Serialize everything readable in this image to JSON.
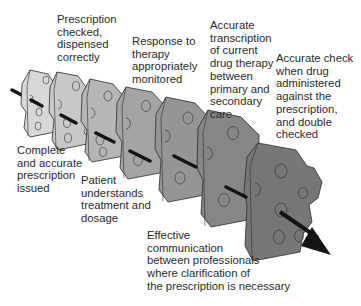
{
  "colors": {
    "background": "#ffffff",
    "text": "#2a2a2a",
    "outline": "#2b2b2b",
    "arrow": "#141414",
    "slice_fills": [
      "#dcdcdc",
      "#c9c9c9",
      "#b7b7b7",
      "#a5a5a5",
      "#959595",
      "#868686",
      "#787878"
    ]
  },
  "icons": {
    "cheese_slice": "cheese-slice-icon",
    "arrow": "trajectory-arrow-icon"
  },
  "labels": [
    {
      "id": "complete-prescription",
      "text": "Complete\nand accurate\nprescription\nissued",
      "position": "below",
      "slice": 1
    },
    {
      "id": "prescription-checked",
      "text": "Prescription\nchecked,\ndispensed\ncorrectly",
      "position": "above",
      "slice": 2
    },
    {
      "id": "patient-understands",
      "text": "Patient\nunderstands\ntreatment and\ndosage",
      "position": "below",
      "slice": 3
    },
    {
      "id": "response-monitored",
      "text": "Response to\ntherapy\nappropriately\nmonitored",
      "position": "above",
      "slice": 4
    },
    {
      "id": "effective-communication",
      "text": "Effective\ncommunication\nbetween professionals\nwhere clarification of\nthe prescription is necessary",
      "position": "below",
      "slice": 5
    },
    {
      "id": "accurate-transcription",
      "text": "Accurate\ntranscription\nof current\ndrug therapy\nbetween\nprimary and\nsecondary\ncare",
      "position": "above",
      "slice": 6
    },
    {
      "id": "accurate-check",
      "text": "Accurate check\nwhen drug\nadministered\nagainst the\nprescription,\nand double\nchecked",
      "position": "above",
      "slice": 7
    }
  ]
}
